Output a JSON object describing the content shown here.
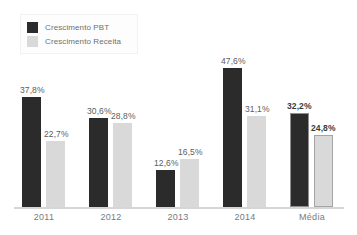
{
  "chart_data": {
    "type": "bar",
    "title": "",
    "subtitle": "",
    "xlabel": "",
    "ylabel": "",
    "ylim": [
      0,
      52
    ],
    "grid": false,
    "legend_position": "top-left",
    "categories": [
      "2011",
      "2012",
      "2013",
      "2014",
      "Média"
    ],
    "series": [
      {
        "name": "Crescimento PBT",
        "color": "#2b2b2b",
        "values": [
          37.8,
          30.6,
          12.6,
          47.6,
          32.2
        ],
        "labels": [
          "37,8%",
          "30,6%",
          "12,6%",
          "47,6%",
          "32,2%"
        ]
      },
      {
        "name": "Crescimento Receita",
        "color": "#d9d9d9",
        "values": [
          22.7,
          28.8,
          16.5,
          31.1,
          24.8
        ],
        "labels": [
          "22,7%",
          "28,8%",
          "16,5%",
          "31,1%",
          "24,8%"
        ]
      }
    ],
    "emphasized_category": "Média",
    "value_suffix": "%",
    "decimal_separator": ","
  },
  "legend": {
    "items": [
      {
        "label": "Crescimento PBT",
        "swatch": "#2b2b2b"
      },
      {
        "label": "Crescimento Receita",
        "swatch": "#d9d9d9"
      }
    ]
  },
  "axis": {
    "categories": [
      "2011",
      "2012",
      "2013",
      "2014",
      "Média"
    ]
  }
}
